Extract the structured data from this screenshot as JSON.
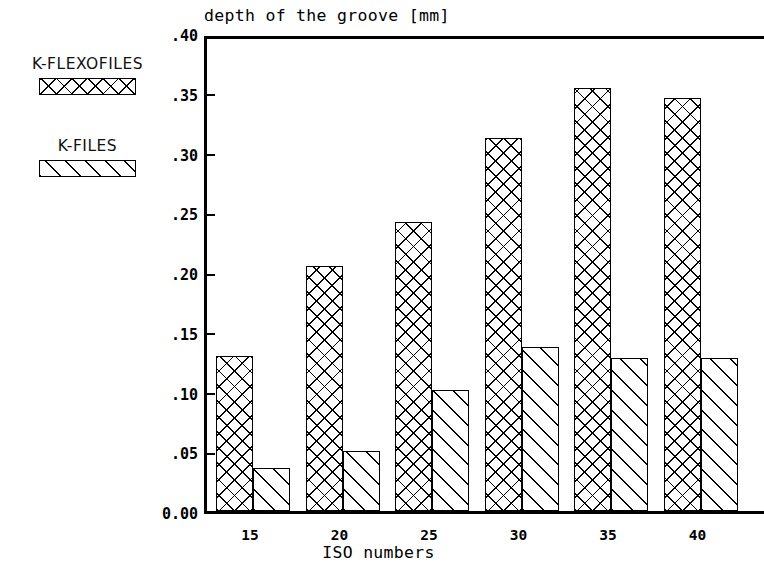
{
  "chart_data": {
    "type": "bar",
    "title": "depth of the groove [mm]",
    "xlabel": "ISO numbers",
    "ylabel": "",
    "categories": [
      "15",
      "20",
      "25",
      "30",
      "35",
      "40"
    ],
    "series": [
      {
        "name": "K-FLEXOFILES",
        "pattern": "cross-hatch",
        "values": [
          0.13,
          0.205,
          0.242,
          0.312,
          0.354,
          0.346
        ]
      },
      {
        "name": "K-FILES",
        "pattern": "diagonal-hatch",
        "values": [
          0.036,
          0.05,
          0.101,
          0.137,
          0.128,
          0.128
        ]
      }
    ],
    "ylim": [
      0.0,
      0.4
    ],
    "ytick_values": [
      0.0,
      0.05,
      0.1,
      0.15,
      0.2,
      0.25,
      0.3,
      0.35,
      0.4
    ],
    "ytick_labels": [
      "0.00",
      ".05",
      ".10",
      ".15",
      ".20",
      ".25",
      ".30",
      ".35",
      ".40"
    ],
    "grid": false,
    "legend_position": "outside-left"
  },
  "legend": {
    "entries": [
      {
        "label": "K-FLEXOFILES"
      },
      {
        "label": "K-FILES"
      }
    ]
  },
  "colors": {
    "axis": "#000000",
    "background": "#ffffff",
    "hatch": "#000000"
  }
}
